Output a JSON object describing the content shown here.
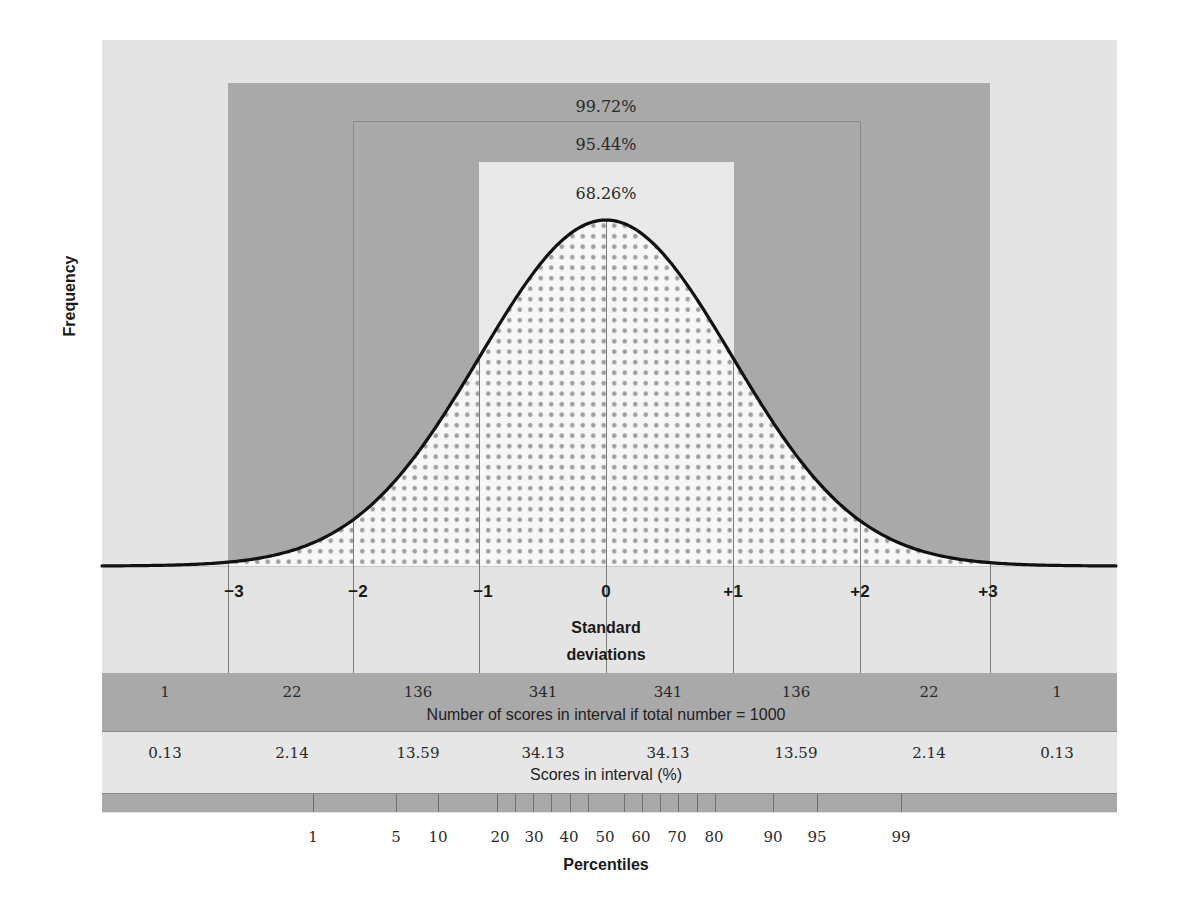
{
  "chart_data": {
    "type": "area",
    "ylabel": "Frequency",
    "xlabel": "Standard deviations",
    "distribution": {
      "mean": 0,
      "sd": 1,
      "x_range": [
        -4,
        4
      ]
    },
    "sd_ticks": [
      "−3",
      "−2",
      "−1",
      "0",
      "+1",
      "+2",
      "+3"
    ],
    "sd_values": [
      -3,
      -2,
      -1,
      0,
      1,
      2,
      3
    ],
    "coverage_bands": [
      {
        "label": "99.72%",
        "range": [
          -3,
          3
        ]
      },
      {
        "label": "95.44%",
        "range": [
          -2,
          2
        ]
      },
      {
        "label": "68.26%",
        "range": [
          -1,
          1
        ]
      }
    ],
    "intervals": [
      "<-3",
      "-3 to -2",
      "-2 to -1",
      "-1 to 0",
      "0 to +1",
      "+1 to +2",
      "+2 to +3",
      ">+3"
    ],
    "series": [
      {
        "name": "Number of scores in interval if total number = 1000",
        "values": [
          "1",
          "22",
          "136",
          "341",
          "341",
          "136",
          "22",
          "1"
        ]
      },
      {
        "name": "Scores in interval (%)",
        "values": [
          "0.13",
          "2.14",
          "13.59",
          "34.13",
          "34.13",
          "13.59",
          "2.14",
          "0.13"
        ]
      }
    ],
    "percentiles": {
      "title": "Percentiles",
      "labels": [
        {
          "text": "1",
          "x": 313
        },
        {
          "text": "5",
          "x": 396
        },
        {
          "text": "10",
          "x": 438
        },
        {
          "text": "20",
          "x": 500
        },
        {
          "text": "30",
          "x": 534
        },
        {
          "text": "40",
          "x": 569
        },
        {
          "text": "50",
          "x": 605
        },
        {
          "text": "60",
          "x": 641
        },
        {
          "text": "70",
          "x": 677
        },
        {
          "text": "80",
          "x": 714
        },
        {
          "text": "90",
          "x": 773
        },
        {
          "text": "95",
          "x": 817
        },
        {
          "text": "99",
          "x": 901
        }
      ],
      "ticks_x": [
        313,
        396,
        438,
        497,
        515,
        533,
        551,
        570,
        588,
        624,
        642,
        660,
        678,
        697,
        715,
        773,
        817,
        901
      ]
    }
  },
  "labels": {
    "frequency": "Frequency",
    "sd_line1": "Standard",
    "sd_line2": "deviations",
    "row1_caption": "Number of scores in interval if total number = 1000",
    "row2_caption": "Scores in interval (%)",
    "percentiles": "Percentiles",
    "band_9972": "99.72%",
    "band_9544": "95.44%",
    "band_6826": "68.26%"
  },
  "colors": {
    "panel": "#e4e4e4",
    "dark_band": "#a9a9a9",
    "inner_band": "#e9e9e9",
    "under_curve": "#f7f7f7",
    "dots": "#9e9e9e",
    "curve": "#111111",
    "grid_line": "#7a7a7a"
  }
}
